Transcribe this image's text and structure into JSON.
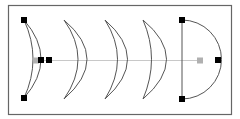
{
  "diagram": {
    "colors": {
      "frame": "#666666",
      "stroke": "#555555",
      "guide": "#c8c8c8",
      "handle": "#000000",
      "anchor": "#b0b0b0"
    },
    "frame": {
      "x": 8,
      "y": 5,
      "w": 223,
      "h": 109
    },
    "shapes": [
      {
        "name": "crescent-1",
        "d": "M24,20 Q58,59 24,98 Q42,59 24,20 Z"
      },
      {
        "name": "crescent-2",
        "d": "M64,20 Q110,59 64,99 Q92,59 64,20 Z"
      },
      {
        "name": "crescent-3",
        "d": "M105,20 Q150,59 105,99 Q130,59 105,20 Z"
      },
      {
        "name": "crescent-4",
        "d": "M143,20 Q190,59 143,99 Q160,59 143,20 Z"
      },
      {
        "name": "half-disc",
        "d": "M182,20 A39,39 0 0 1 182,99 L182,20 Z"
      }
    ],
    "guide_line": {
      "x1": 36,
      "y1": 60,
      "x2": 200,
      "y2": 60
    },
    "handles": [
      {
        "name": "crescent-top-handle",
        "x": 24,
        "y": 20
      },
      {
        "name": "crescent-bottom-handle",
        "x": 24,
        "y": 98
      },
      {
        "name": "crescent-inner-handle",
        "x": 41,
        "y": 60
      },
      {
        "name": "crescent-outer-handle",
        "x": 49,
        "y": 60
      },
      {
        "name": "halfdisc-top-handle",
        "x": 182,
        "y": 20
      },
      {
        "name": "halfdisc-bottom-handle",
        "x": 182,
        "y": 99
      },
      {
        "name": "halfdisc-right-handle",
        "x": 218,
        "y": 60
      }
    ],
    "anchors": [
      {
        "name": "start-anchor",
        "x": 36,
        "y": 60
      },
      {
        "name": "end-anchor",
        "x": 200,
        "y": 60
      }
    ]
  }
}
